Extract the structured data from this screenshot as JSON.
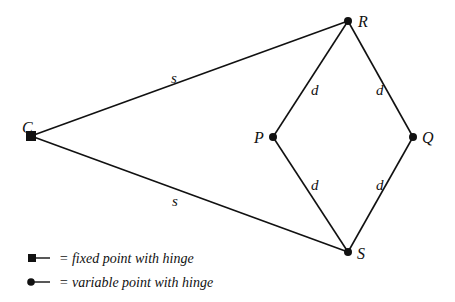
{
  "diagram": {
    "points": {
      "C": {
        "label": "C",
        "x": 31,
        "y": 136,
        "kind": "fixed"
      },
      "R": {
        "label": "R",
        "x": 348,
        "y": 21,
        "kind": "variable"
      },
      "P": {
        "label": "P",
        "x": 273,
        "y": 137,
        "kind": "variable"
      },
      "Q": {
        "label": "Q",
        "x": 413,
        "y": 137,
        "kind": "variable"
      },
      "S": {
        "label": "S",
        "x": 348,
        "y": 252,
        "kind": "variable"
      }
    },
    "links": [
      {
        "from": "C",
        "to": "R",
        "label": "s"
      },
      {
        "from": "C",
        "to": "S",
        "label": "s"
      },
      {
        "from": "R",
        "to": "P",
        "label": "d"
      },
      {
        "from": "R",
        "to": "Q",
        "label": "d"
      },
      {
        "from": "P",
        "to": "S",
        "label": "d"
      },
      {
        "from": "Q",
        "to": "S",
        "label": "d"
      }
    ],
    "link_labels": {
      "s_upper": "s",
      "s_lower": "s",
      "d_rp": "d",
      "d_rq": "d",
      "d_ps": "d",
      "d_qs": "d"
    }
  },
  "legend": {
    "fixed": "= fixed point with hinge",
    "variable": "= variable point with hinge"
  },
  "colors": {
    "line": "#111111",
    "background": "#ffffff"
  }
}
